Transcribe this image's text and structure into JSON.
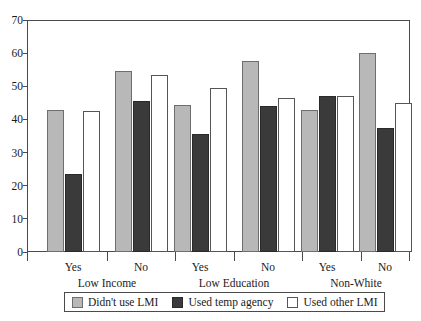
{
  "chart_data": {
    "type": "bar",
    "title": "",
    "subtitle": "",
    "xlabel": "",
    "ylabel": "",
    "ylim": [
      0,
      70
    ],
    "yticks": [
      0,
      10,
      20,
      30,
      40,
      50,
      60,
      70
    ],
    "grid": false,
    "legend_position": "bottom",
    "group_labels": [
      "Low Income",
      "Low Education",
      "Non-White"
    ],
    "categories": [
      "Yes",
      "No",
      "Yes",
      "No",
      "Yes",
      "No"
    ],
    "series": [
      {
        "name": "Didn't use LMI",
        "color": "#b8b8b8",
        "values": [
          43,
          54.5,
          44.5,
          57.5,
          43,
          60
        ]
      },
      {
        "name": "Used temp agency",
        "color": "#3a3a3a",
        "values": [
          23.5,
          45.5,
          35.5,
          44,
          47,
          37.5
        ]
      },
      {
        "name": "Used other LMI",
        "color": "#ffffff",
        "values": [
          42.5,
          53.5,
          49.5,
          46.5,
          47,
          45
        ]
      }
    ]
  },
  "axis": {
    "y_tick_labels": [
      "70",
      "60",
      "50",
      "40",
      "30",
      "20",
      "10",
      "0"
    ],
    "category_labels": [
      "Yes",
      "No",
      "Yes",
      "No",
      "Yes",
      "No"
    ],
    "group_labels": [
      "Low Income",
      "Low Education",
      "Non-White"
    ]
  },
  "legend": {
    "items": [
      {
        "label": "Didn't use LMI",
        "color": "#b8b8b8"
      },
      {
        "label": "Used temp agency",
        "color": "#3a3a3a"
      },
      {
        "label": "Used other LMI",
        "color": "#ffffff"
      }
    ]
  }
}
